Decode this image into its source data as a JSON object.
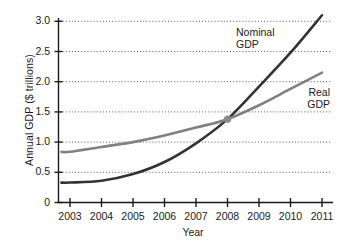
{
  "chart_data": {
    "type": "line",
    "title": "",
    "xlabel": "Year",
    "ylabel": "Annual GDP ($ trillions)",
    "x": [
      2003,
      2004,
      2005,
      2006,
      2007,
      2008,
      2009,
      2010,
      2011
    ],
    "xtick_labels": [
      "2003",
      "2004",
      "2005",
      "2006",
      "2007",
      "2008",
      "2009",
      "2010",
      "2011"
    ],
    "ytick_labels": [
      "0",
      "0.5",
      "1.0",
      "1.5",
      "2.0",
      "2.5",
      "3.0"
    ],
    "ytick_values": [
      0,
      0.5,
      1.0,
      1.5,
      2.0,
      2.5,
      3.0
    ],
    "xlim": [
      2002.75,
      2011.1
    ],
    "ylim": [
      0,
      3.15
    ],
    "grid": "horizontal-dotted",
    "legend": "inline-annotations",
    "series": [
      {
        "name": "Nominal GDP",
        "label_lines": [
          "Nominal",
          "GDP"
        ],
        "color": "#333333",
        "values": [
          0.33,
          0.36,
          0.47,
          0.67,
          0.98,
          1.38,
          1.92,
          2.48,
          3.1
        ]
      },
      {
        "name": "Real GDP",
        "label_lines": [
          "Real",
          "GDP"
        ],
        "color": "#808080",
        "values": [
          0.84,
          0.92,
          1.0,
          1.11,
          1.24,
          1.38,
          1.61,
          1.88,
          2.15
        ]
      }
    ],
    "annotations": [
      {
        "name": "crossover-marker",
        "x": 2008,
        "y": 1.38,
        "color": "#8a8a8a",
        "shape": "circle"
      }
    ]
  }
}
